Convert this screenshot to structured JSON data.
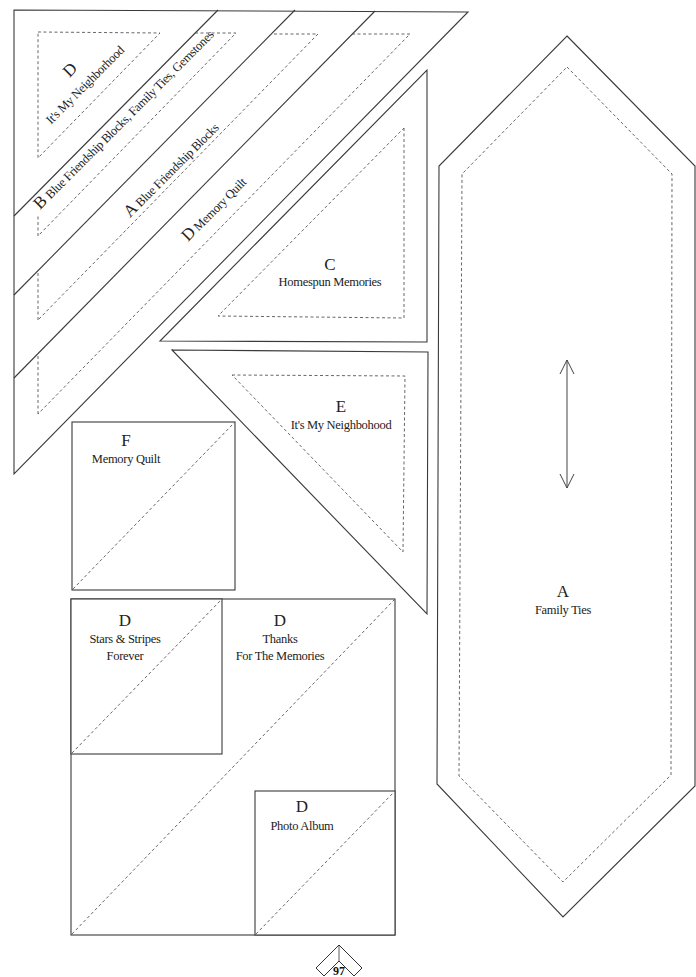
{
  "page": {
    "number": "97",
    "line_color": "#3a3a3a",
    "seam_color": "#555555"
  },
  "pieces": {
    "strip_d_neighborhood": {
      "letter": "D",
      "name": "It's My Neighborhood"
    },
    "strip_b": {
      "letter": "B",
      "name": "Blue Friendship Blocks, Family Ties, Gemstones"
    },
    "strip_a": {
      "letter": "A",
      "name": "Blue Friendship Blocks"
    },
    "strip_d_memory": {
      "letter": "D",
      "name": "Memory Quilt"
    },
    "triangle_c": {
      "letter": "C",
      "name": "Homespun Memories"
    },
    "triangle_e": {
      "letter": "E",
      "name": "It's My Neighbohood"
    },
    "square_f": {
      "letter": "F",
      "name": "Memory Quilt"
    },
    "square_d_stars": {
      "letter": "D",
      "name_line1": "Stars & Stripes",
      "name_line2": "Forever"
    },
    "square_d_thanks": {
      "letter": "D",
      "name_line1": "Thanks",
      "name_line2": "For The Memories"
    },
    "square_d_photo": {
      "letter": "D",
      "name": "Photo Album"
    },
    "hexagon_a": {
      "letter": "A",
      "name": "Family Ties",
      "grainline": "double-arrow"
    }
  }
}
